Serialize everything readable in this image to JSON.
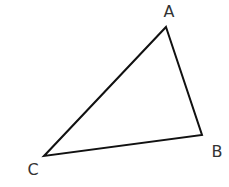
{
  "diagram": {
    "type": "triangle",
    "stroke_color": "#111111",
    "label_color": "#333333",
    "background": "#ffffff",
    "vertices": [
      {
        "name": "A",
        "x": 166,
        "y": 27,
        "label_x": 169,
        "label_y": 17
      },
      {
        "name": "B",
        "x": 202,
        "y": 135,
        "label_x": 217,
        "label_y": 157
      },
      {
        "name": "C",
        "x": 44,
        "y": 156,
        "label_x": 33,
        "label_y": 175
      }
    ],
    "edges": [
      {
        "from": "A",
        "to": "B"
      },
      {
        "from": "B",
        "to": "C"
      },
      {
        "from": "C",
        "to": "A"
      }
    ]
  }
}
